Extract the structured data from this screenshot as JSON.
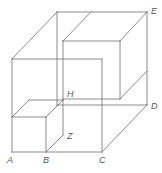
{
  "diagram": {
    "title": "",
    "colors": {
      "line": "#6e6e6e",
      "label": "#555555",
      "background": "#ffffff"
    },
    "labels": {
      "A": "A",
      "B": "B",
      "C": "C",
      "D": "D",
      "E": "E",
      "H": "H",
      "Z": "Z"
    }
  }
}
